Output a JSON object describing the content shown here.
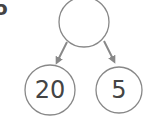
{
  "diagram": {
    "type": "binary-tree",
    "partial_label": "o",
    "root": {
      "value": ""
    },
    "children": [
      {
        "side": "left",
        "value": "20"
      },
      {
        "side": "right",
        "value": "5"
      }
    ],
    "colors": {
      "node_stroke": "#888888",
      "arrow": "#888888",
      "text": "#444444",
      "background": "#ffffff"
    }
  }
}
